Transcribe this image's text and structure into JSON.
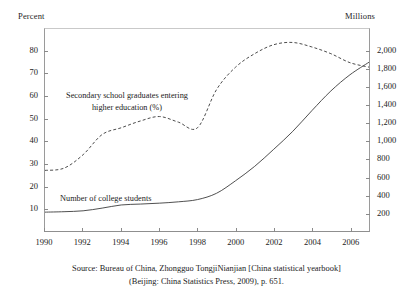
{
  "chart_data": {
    "type": "line",
    "title": "",
    "xlabel": "",
    "ylabel": "Percent",
    "y2label": "Millions",
    "xlim": [
      1990,
      2007
    ],
    "ylim": [
      0,
      90
    ],
    "y2lim": [
      0,
      2250
    ],
    "grid": false,
    "legend": "inline-annotations",
    "xticks": [
      "1990",
      "1992",
      "1994",
      "1996",
      "1998",
      "2000",
      "2002",
      "2004",
      "2006"
    ],
    "xtick_values": [
      1990,
      1992,
      1994,
      1996,
      1998,
      2000,
      2002,
      2004,
      2006
    ],
    "yticks_left": [
      "10",
      "20",
      "30",
      "40",
      "50",
      "60",
      "70",
      "80"
    ],
    "ytick_values_left": [
      10,
      20,
      30,
      40,
      50,
      60,
      70,
      80
    ],
    "yticks_right": [
      "200",
      "400",
      "600",
      "800",
      "1,000",
      "1,200",
      "1,400",
      "1,600",
      "1,800",
      "2,000"
    ],
    "ytick_values_right": [
      200,
      400,
      600,
      800,
      1000,
      1200,
      1400,
      1600,
      1800,
      2000
    ],
    "x": [
      1990,
      1991,
      1992,
      1993,
      1994,
      1995,
      1996,
      1997,
      1998,
      1999,
      2000,
      2001,
      2002,
      2003,
      2004,
      2005,
      2006,
      2007
    ],
    "series": [
      {
        "name": "Secondary school graduates entering higher education (%)",
        "style": "dashed",
        "axis": "left",
        "color": "#4a4a4a",
        "values": [
          27,
          28,
          34,
          43,
          46,
          49,
          51,
          48.5,
          46,
          63,
          73,
          79,
          83,
          84,
          82,
          79,
          75,
          73
        ]
      },
      {
        "name": "Number of college students",
        "style": "solid",
        "axis": "right",
        "color": "#3a3a3a",
        "values": [
          210,
          215,
          225,
          255,
          290,
          300,
          310,
          325,
          350,
          420,
          560,
          720,
          910,
          1110,
          1340,
          1560,
          1740,
          1880
        ]
      }
    ],
    "annotations": [
      {
        "text_line1": "Secondary school graduates entering",
        "text_line2": "higher education (%)"
      },
      {
        "text_line1": "Number of college students"
      }
    ]
  },
  "axis_titles": {
    "left": "Percent",
    "right": "Millions"
  },
  "annotations": {
    "dashed_line1": "Secondary school graduates entering",
    "dashed_line2": "higher education (%)",
    "solid_line1": "Number of college students"
  },
  "caption": {
    "line1": "Source: Bureau of China, Zhongguo TongjiNianjian [China statistical yearbook]",
    "line2": "(Beijing: China Statistics Press, 2009), p. 651."
  }
}
